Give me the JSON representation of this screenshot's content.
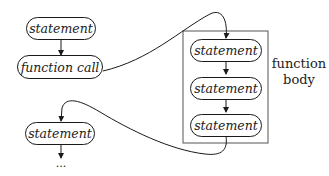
{
  "diagram": {
    "caller": {
      "nodes": [
        {
          "label": "statement"
        },
        {
          "label": "function call"
        }
      ],
      "after_return": {
        "label": "statement"
      },
      "continuation": "..."
    },
    "function_body": {
      "caption_line1": "function",
      "caption_line2": "body",
      "nodes": [
        {
          "label": "statement"
        },
        {
          "label": "statement"
        },
        {
          "label": "statement"
        }
      ]
    },
    "colors": {
      "stroke": "#1a1a1a",
      "frame": "#555555",
      "background": "#ffffff"
    }
  }
}
